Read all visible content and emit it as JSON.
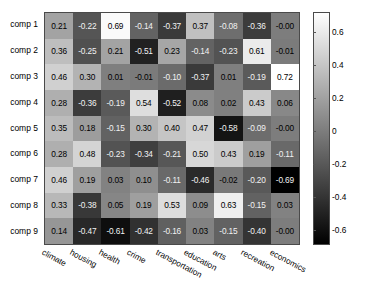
{
  "chart_data": {
    "type": "heatmap",
    "title": "",
    "xlabel": "",
    "ylabel": "",
    "categories_x": [
      "climate",
      "housing",
      "health",
      "crime",
      "transportation",
      "education",
      "arts",
      "recreation",
      "economics"
    ],
    "categories_y": [
      "comp 1",
      "comp 2",
      "comp 3",
      "comp 4",
      "comp 5",
      "comp 6",
      "comp 7",
      "comp 8",
      "comp 9"
    ],
    "colormap": "gray",
    "grid": false,
    "legend_position": "right",
    "colorbar": {
      "ticks": [
        "0.6",
        "0.4",
        "0.2",
        "0",
        "-0.2",
        "-0.4",
        "-0.6"
      ],
      "tick_values": [
        0.6,
        0.4,
        0.2,
        0,
        -0.2,
        -0.4,
        -0.6
      ],
      "vmin": -0.69,
      "vmax": 0.72
    },
    "values": [
      [
        0.21,
        -0.22,
        0.69,
        -0.14,
        -0.37,
        0.37,
        -0.08,
        -0.36,
        -0.0
      ],
      [
        0.36,
        -0.25,
        0.21,
        -0.51,
        0.23,
        -0.14,
        -0.23,
        0.61,
        -0.01
      ],
      [
        0.46,
        0.3,
        0.01,
        -0.01,
        -0.1,
        -0.37,
        0.01,
        -0.19,
        0.72
      ],
      [
        0.28,
        -0.36,
        -0.19,
        0.54,
        -0.52,
        0.08,
        0.02,
        0.43,
        0.06
      ],
      [
        0.35,
        0.18,
        -0.15,
        0.3,
        0.4,
        0.47,
        -0.58,
        -0.09,
        -0.0
      ],
      [
        0.28,
        0.48,
        -0.23,
        -0.34,
        -0.21,
        0.5,
        0.43,
        0.19,
        -0.11
      ],
      [
        0.46,
        0.19,
        0.03,
        0.1,
        -0.11,
        -0.46,
        -0.02,
        -0.2,
        -0.69
      ],
      [
        0.33,
        -0.38,
        0.05,
        0.19,
        0.53,
        0.09,
        0.63,
        -0.15,
        0.03
      ],
      [
        0.14,
        -0.47,
        -0.61,
        -0.42,
        -0.16,
        0.03,
        -0.15,
        -0.4,
        -0.0
      ]
    ],
    "labels": [
      [
        "0.21",
        "-0.22",
        "0.69",
        "-0.14",
        "-0.37",
        "0.37",
        "-0.08",
        "-0.36",
        "-0.00"
      ],
      [
        "0.36",
        "-0.25",
        "0.21",
        "-0.51",
        "0.23",
        "-0.14",
        "-0.23",
        "0.61",
        "-0.01"
      ],
      [
        "0.46",
        "0.30",
        "0.01",
        "-0.01",
        "-0.10",
        "-0.37",
        "0.01",
        "-0.19",
        "0.72"
      ],
      [
        "0.28",
        "-0.36",
        "-0.19",
        "0.54",
        "-0.52",
        "0.08",
        "0.02",
        "0.43",
        "0.06"
      ],
      [
        "0.35",
        "0.18",
        "-0.15",
        "0.30",
        "0.40",
        "0.47",
        "-0.58",
        "-0.09",
        "-0.00"
      ],
      [
        "0.28",
        "0.48",
        "-0.23",
        "-0.34",
        "-0.21",
        "0.50",
        "0.43",
        "0.19",
        "-0.11"
      ],
      [
        "0.46",
        "0.19",
        "0.03",
        "0.10",
        "-0.11",
        "-0.46",
        "-0.02",
        "-0.20",
        "-0.69"
      ],
      [
        "0.33",
        "-0.38",
        "0.05",
        "0.19",
        "0.53",
        "0.09",
        "0.63",
        "-0.15",
        "0.03"
      ],
      [
        "0.14",
        "-0.47",
        "-0.61",
        "-0.42",
        "-0.16",
        "0.03",
        "-0.15",
        "-0.40",
        "-0.00"
      ]
    ]
  }
}
